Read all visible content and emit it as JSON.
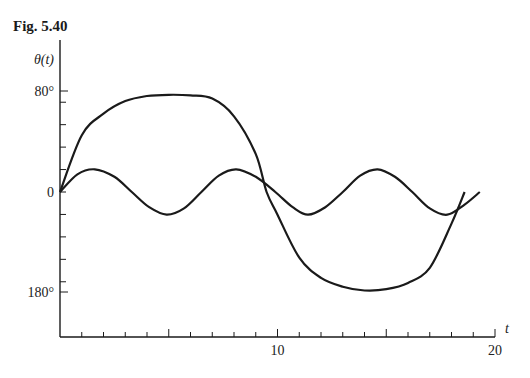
{
  "figure": {
    "title": "Fig. 5.40"
  },
  "chart_data": {
    "type": "line",
    "title": "Fig. 5.40",
    "xlabel": "t",
    "ylabel": "θ(t)",
    "x_ticks": [
      0,
      1,
      2,
      3,
      4,
      5,
      6,
      7,
      8,
      9,
      10,
      11,
      12,
      13,
      14,
      15,
      16,
      17,
      18,
      19,
      20
    ],
    "x_tick_labels": [
      {
        "value": 10,
        "label": "10"
      },
      {
        "value": 20,
        "label": "20"
      }
    ],
    "y_tick_labels": [
      {
        "value": 80,
        "label": "80°"
      },
      {
        "value": 0,
        "label": "0"
      },
      {
        "value": -80,
        "label": "180°"
      }
    ],
    "xlim": [
      0,
      20
    ],
    "grid": false,
    "legend": null,
    "series": [
      {
        "name": "large-amplitude solution",
        "x": [
          0,
          1,
          2,
          3,
          4,
          5,
          6,
          7,
          8,
          9,
          9.5,
          10,
          11,
          12,
          13,
          14,
          15,
          16,
          17,
          18,
          18.6
        ],
        "y": [
          0,
          45,
          62,
          72,
          76,
          77,
          76.5,
          74,
          60,
          30,
          0,
          -18,
          -52,
          -68,
          -75,
          -78,
          -77,
          -72,
          -60,
          -25,
          0
        ]
      },
      {
        "name": "small-amplitude solution",
        "x": [
          0,
          0.8,
          1.6,
          2.5,
          3.3,
          4.1,
          4.9,
          5.7,
          6.5,
          7.3,
          8.1,
          9.0,
          9.9,
          10.7,
          11.4,
          12.2,
          13.0,
          13.8,
          14.6,
          15.4,
          16.2,
          17.0,
          17.8,
          18.6,
          19.3
        ],
        "y": [
          0,
          14,
          18,
          12,
          0,
          -12,
          -18,
          -13,
          0,
          13,
          18,
          12,
          0,
          -12,
          -18,
          -12,
          0,
          13,
          18,
          12,
          0,
          -13,
          -18,
          -10,
          0
        ]
      }
    ]
  }
}
